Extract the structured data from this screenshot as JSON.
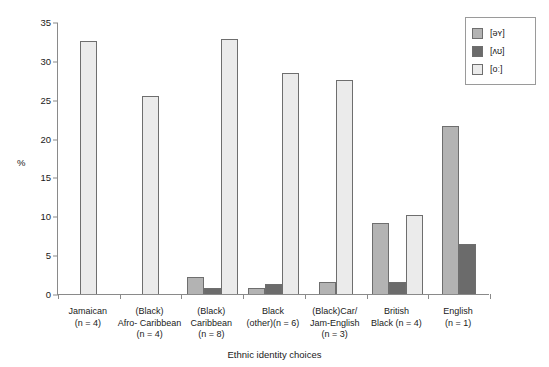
{
  "chart_data": {
    "type": "bar",
    "title": "",
    "xlabel": "Ethnic identity choices",
    "ylabel": "%",
    "ylim": [
      0,
      35
    ],
    "yticks": [
      0,
      5,
      10,
      15,
      20,
      25,
      30,
      35
    ],
    "grid": false,
    "legend_position": "top-right",
    "categories": [
      "Jamaican (n = 4)",
      "(Black) Afro- Caribbean (n = 4)",
      "(Black) Caribbean (n = 8)",
      "Black (other)(n = 6)",
      "(Black)Car/ Jam-English (n = 3)",
      "British Black (n = 4)",
      "English (n = 1)"
    ],
    "series": [
      {
        "name": "[əʏ]",
        "color": "#b3b3b3",
        "values": [
          0,
          0,
          2.2,
          0.8,
          1.6,
          9.1,
          21.6
        ]
      },
      {
        "name": "[ʌʊ]",
        "color": "#6b6b6b",
        "values": [
          0,
          0,
          0.8,
          1.3,
          0,
          1.5,
          6.4
        ]
      },
      {
        "name": "[oː]",
        "color": "#ebebeb",
        "values": [
          32.5,
          25.5,
          32.8,
          28.4,
          27.5,
          10.2,
          0
        ]
      }
    ]
  },
  "axis": {
    "y_label": "%",
    "x_title": "Ethnic identity choices",
    "y_ticks": [
      "0",
      "5",
      "10",
      "15",
      "20",
      "25",
      "30",
      "35"
    ]
  },
  "legend": {
    "entries": [
      {
        "label": "[əʏ]",
        "swatch": "legend-swatch-medium-gray"
      },
      {
        "label": "[ʌʊ]",
        "swatch": "legend-swatch-dark-gray"
      },
      {
        "label": "[oː]",
        "swatch": "legend-swatch-light-gray"
      }
    ]
  },
  "x_labels": [
    [
      "Jamaican",
      "(n = 4)"
    ],
    [
      "(Black)",
      "Afro- Caribbean",
      "(n = 4)"
    ],
    [
      "(Black)",
      "Caribbean",
      "(n = 8)"
    ],
    [
      "Black",
      "(other)(n = 6)"
    ],
    [
      "(Black)Car/",
      "Jam-English",
      "(n = 3)"
    ],
    [
      "British",
      "Black (n = 4)"
    ],
    [
      "English",
      "(n = 1)"
    ]
  ]
}
